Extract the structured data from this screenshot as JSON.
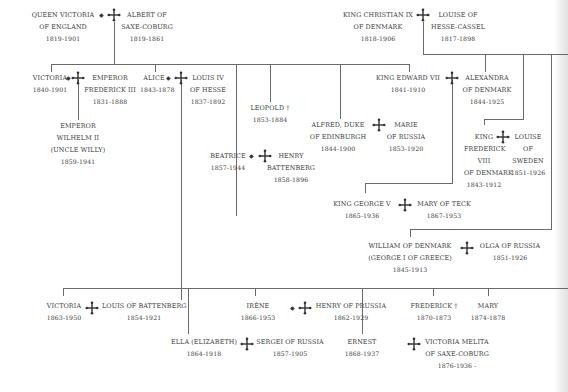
{
  "diagram": {
    "type": "family-tree",
    "colors": {
      "text": "#3a3a3a",
      "lines": "#6a6a6a",
      "background": "#ffffff"
    },
    "symbols": {
      "marriage": "marriage-cross-icon",
      "died_young": "†",
      "diamond": "◆"
    },
    "people": {
      "queen_victoria": {
        "name1": "QUEEN VICTORIA",
        "name2": "OF ENGLAND",
        "dates": "1819-1901"
      },
      "albert": {
        "name1": "ALBERT OF",
        "name2": "SAXE-COBURG",
        "dates": "1819-1861"
      },
      "christian_ix": {
        "name1": "KING CHRISTIAN IX",
        "name2": "OF DENMARK",
        "dates": "1818-1906"
      },
      "louise_hc": {
        "name1": "LOUISE OF",
        "name2": "HESSE-CASSEL",
        "dates": "1817-1898"
      },
      "victoria_pr": {
        "name1": "VICTORIA",
        "dates": "1840-1901"
      },
      "frederick_iii": {
        "name1": "EMPEROR",
        "name2": "FREDERICK III",
        "dates": "1831-1888"
      },
      "alice": {
        "name1": "ALICE",
        "dates": "1843-1878"
      },
      "louis_iv": {
        "name1": "LOUIS IV",
        "name2": "OF HESSE",
        "dates": "1837-1892"
      },
      "leopold": {
        "name1": "LEOPOLD †",
        "dates": "1853-1884"
      },
      "edward_vii": {
        "name1": "KING EDWARD VII",
        "dates": "1841-1910"
      },
      "alexandra": {
        "name1": "ALEXANDRA",
        "name2": "OF DENMARK",
        "dates": "1844-1925"
      },
      "wilhelm_ii": {
        "name1": "EMPEROR",
        "name2": "WILHELM II",
        "name3": "(UNCLE WILLY)",
        "dates": "1859-1941"
      },
      "alfred": {
        "name1": "ALFRED, DUKE",
        "name2": "OF EDINBURGH",
        "dates": "1844-1900"
      },
      "marie": {
        "name1": "MARIE",
        "name2": "OF RUSSIA",
        "dates": "1853-1920"
      },
      "frederick_viii": {
        "name1": "KING",
        "name2": "FREDERICK",
        "name3": "VIII",
        "name4": "OF DENMARK",
        "dates": "1843-1912"
      },
      "louise_sw": {
        "name1": "LOUISE",
        "name2": "OF",
        "name3": "SWEDEN",
        "dates": "1851-1926"
      },
      "beatrice": {
        "name1": "BEATRICE",
        "dates": "1857-1944"
      },
      "henry_b": {
        "name1": "HENRY",
        "name2": "BATTENBERG",
        "dates": "1858-1896"
      },
      "george_v": {
        "name1": "KING GEORGE V",
        "dates": "1865-1936"
      },
      "mary_teck": {
        "name1": "MARY OF TECK",
        "dates": "1867-1953"
      },
      "william_dk": {
        "name1": "WILLIAM OF DENMARK",
        "name2": "(GEORGE I OF GREECE)",
        "dates": "1845-1913"
      },
      "olga": {
        "name1": "OLGA OF RUSSIA",
        "dates": "1851-1926"
      },
      "victoria_h": {
        "name1": "VICTORIA",
        "dates": "1863-1950"
      },
      "louis_b": {
        "name1": "LOUIS OF BATTENBERG",
        "dates": "1854-1921"
      },
      "irene": {
        "name1": "IRÈNE",
        "dates": "1866-1953"
      },
      "henry_p": {
        "name1": "HENRY OF PRUSSIA",
        "dates": "1862-1929"
      },
      "frederick_h": {
        "name1": "FREDERICK †",
        "dates": "1870-1873"
      },
      "mary_h": {
        "name1": "MARY",
        "dates": "1874-1878"
      },
      "ella": {
        "name1": "ELLA (ELIZABETH)",
        "dates": "1864-1918"
      },
      "sergei": {
        "name1": "SERGEI OF RUSSIA",
        "dates": "1857-1905"
      },
      "ernest": {
        "name1": "ERNEST",
        "dates": "1868-1937"
      },
      "victoria_melita": {
        "name1": "VICTORIA MELITA",
        "name2": "OF SAXE-COBURG",
        "dates": "1876-1936 -"
      }
    }
  }
}
